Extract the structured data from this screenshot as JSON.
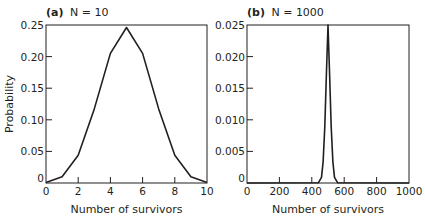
{
  "chart_data": [
    {
      "type": "line",
      "panel_label": "(a)",
      "title": "N = 10",
      "xlabel": "Number of survivors",
      "ylabel": "Probability",
      "xlim": [
        0,
        10
      ],
      "ylim": [
        0,
        0.25
      ],
      "xticks": [
        "0",
        "2",
        "4",
        "6",
        "8",
        "10"
      ],
      "yticks": [
        "0",
        "0.05",
        "0.10",
        "0.15",
        "0.20",
        "0.25"
      ],
      "grid": false,
      "x": [
        0,
        1,
        2,
        3,
        4,
        5,
        6,
        7,
        8,
        9,
        10
      ],
      "values": [
        0.001,
        0.0098,
        0.0439,
        0.1172,
        0.2051,
        0.2461,
        0.2051,
        0.1172,
        0.0439,
        0.0098,
        0.001
      ]
    },
    {
      "type": "line",
      "panel_label": "(b)",
      "title": "N = 1000",
      "xlabel": "Number of survivors",
      "ylabel": "",
      "xlim": [
        0,
        1000
      ],
      "ylim": [
        0,
        0.025
      ],
      "xticks": [
        "0",
        "200",
        "400",
        "600",
        "800",
        "1000"
      ],
      "yticks": [
        "0",
        "0.005",
        "0.010",
        "0.015",
        "0.020",
        "0.025"
      ],
      "grid": false,
      "x": [
        0,
        440,
        460,
        470,
        480,
        490,
        500,
        510,
        520,
        530,
        540,
        560,
        1000
      ],
      "values": [
        0,
        3e-05,
        0.0009,
        0.0033,
        0.0089,
        0.0172,
        0.0252,
        0.0172,
        0.0089,
        0.0033,
        0.0009,
        3e-05,
        0
      ]
    }
  ]
}
